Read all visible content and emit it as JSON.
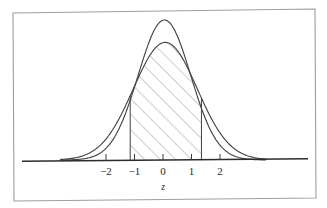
{
  "figure": {
    "background_color": "#ffffff",
    "border_color": "#9a9a9a",
    "ink_color": "#3a3a3a",
    "axis_color": "#2b2b2b",
    "hatch_color": "#8c8c8c",
    "width": 327,
    "height": 208
  },
  "chart_data": {
    "type": "line",
    "title": "",
    "subtitle": "",
    "xlabel": "z",
    "ylabel": "",
    "xlim": [
      -3.6,
      3.6
    ],
    "ylim": [
      0,
      1.15
    ],
    "grid": false,
    "legend": "none",
    "x_tick_labels": [
      "−2",
      "−1",
      "0",
      "1",
      "2"
    ],
    "x_tick_values": [
      -2,
      -1,
      0,
      1,
      2
    ],
    "y_tick_labels": [],
    "annotations": [
      {
        "name": "shaded-area",
        "kind": "hatched-region",
        "under_series": "wide-normal-curve",
        "x_from": -1.15,
        "x_to": 1.35,
        "hatch_direction": "bottom-left-to-top-right"
      }
    ],
    "series": [
      {
        "name": "tall-normal-curve",
        "kind": "normal-pdf",
        "mean": 0.05,
        "sigma": 0.92,
        "peak_height": 1.0,
        "color": "#3a3a3a",
        "filled": false,
        "x": [
          -3.6,
          -3.3,
          -3.0,
          -2.7,
          -2.4,
          -2.1,
          -1.8,
          -1.5,
          -1.2,
          -0.9,
          -0.6,
          -0.3,
          0.0,
          0.3,
          0.6,
          0.9,
          1.2,
          1.5,
          1.8,
          2.1,
          2.4,
          2.7,
          3.0,
          3.3,
          3.6
        ],
        "y": [
          0.001,
          0.003,
          0.007,
          0.018,
          0.039,
          0.079,
          0.144,
          0.239,
          0.364,
          0.503,
          0.64,
          0.754,
          0.851,
          0.928,
          0.975,
          0.99,
          0.971,
          0.896,
          0.77,
          0.619,
          0.463,
          0.32,
          0.205,
          0.122,
          0.067
        ]
      },
      {
        "name": "wide-normal-curve",
        "kind": "normal-pdf",
        "mean": 0.08,
        "sigma": 1.12,
        "peak_height": 0.84,
        "color": "#3a3a3a",
        "filled": false,
        "x": [
          -3.6,
          -3.3,
          -3.0,
          -2.7,
          -2.4,
          -2.1,
          -1.8,
          -1.5,
          -1.2,
          -0.9,
          -0.6,
          -0.3,
          0.0,
          0.3,
          0.6,
          0.9,
          1.2,
          1.5,
          1.8,
          2.1,
          2.4,
          2.7,
          3.0,
          3.3,
          3.6
        ],
        "y": [
          0.005,
          0.012,
          0.026,
          0.051,
          0.092,
          0.153,
          0.236,
          0.339,
          0.454,
          0.569,
          0.672,
          0.753,
          0.806,
          0.829,
          0.821,
          0.782,
          0.717,
          0.633,
          0.538,
          0.44,
          0.347,
          0.264,
          0.194,
          0.138,
          0.095
        ]
      }
    ]
  }
}
